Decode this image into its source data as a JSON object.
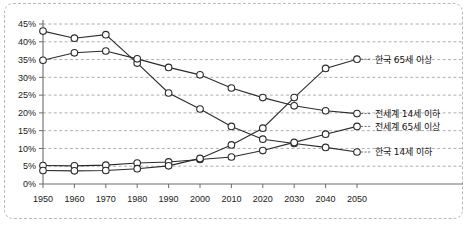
{
  "chart_data": {
    "type": "line",
    "title": "",
    "xlabel": "",
    "ylabel": "",
    "x": [
      1950,
      1960,
      1970,
      1980,
      1990,
      2000,
      2010,
      2020,
      2030,
      2040,
      2050
    ],
    "xlim": [
      1950,
      2050
    ],
    "ylim": [
      0,
      45
    ],
    "ytick_labels": [
      "0%",
      "5%",
      "10%",
      "15%",
      "20%",
      "25%",
      "30%",
      "35%",
      "40%",
      "45%"
    ],
    "ytick_values": [
      0,
      5,
      10,
      15,
      20,
      25,
      30,
      35,
      40,
      45
    ],
    "xtick_labels": [
      "1950",
      "1960",
      "1970",
      "1980",
      "1990",
      "2000",
      "2010",
      "2020",
      "2030",
      "2040",
      "2050"
    ],
    "grid": true,
    "legend_position": "right",
    "series": [
      {
        "name": "한국 14세 이하",
        "label": "한국 14세 이하",
        "values": [
          43,
          41,
          42,
          34,
          25.6,
          21.1,
          16.2,
          12.6,
          11.4,
          10.3,
          9.0
        ],
        "end_value": 9.0
      },
      {
        "name": "전세계 14세 이하",
        "label": "전세계 14세 이하",
        "values": [
          34.8,
          36.9,
          37.4,
          35.2,
          32.8,
          30.7,
          27.0,
          24.3,
          22.0,
          20.6,
          19.8
        ],
        "end_value": 19.8
      },
      {
        "name": "전세계 65세 이상",
        "label": "전세계 65세 이상",
        "values": [
          5.2,
          5.1,
          5.3,
          5.9,
          6.2,
          6.9,
          7.6,
          9.4,
          11.7,
          14.0,
          16.2
        ],
        "end_value": 16.2
      },
      {
        "name": "한국 65세 이상",
        "label": "한국 65세 이상",
        "values": [
          3.8,
          3.7,
          3.8,
          4.3,
          5.1,
          7.2,
          11.0,
          15.7,
          24.3,
          32.5,
          35.1
        ],
        "end_value": 35.1
      }
    ],
    "legend_entries": [
      {
        "label": "한국 65세 이상"
      },
      {
        "label": "전세계 14세 이하"
      },
      {
        "label": "전세계 65세 이상"
      },
      {
        "label": "한국 14세 이하"
      }
    ],
    "colors": {
      "line": "#2b2b2b",
      "marker_fill": "#ffffff",
      "grid": "#9a9a9a",
      "axis": "#6d6d6d",
      "frame": "#b9b9b9",
      "background": "#ffffff"
    }
  }
}
